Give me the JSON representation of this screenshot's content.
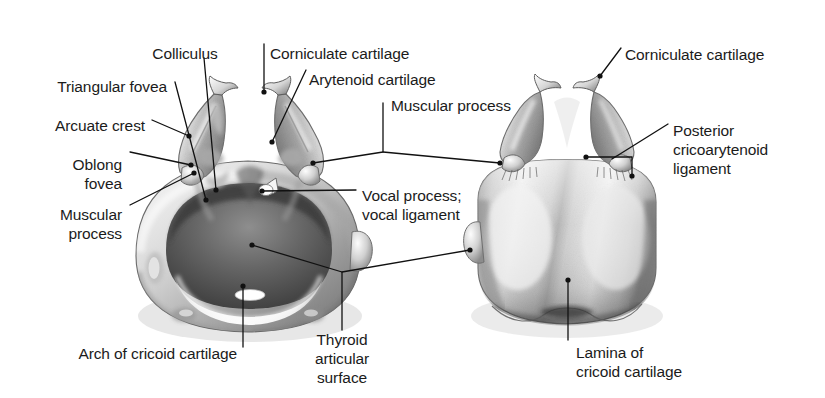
{
  "figure": {
    "background_color": "#ffffff",
    "ink_color": "#1b1b1b",
    "width": 825,
    "height": 398
  },
  "views": [
    {
      "name": "anterosuperior-view",
      "description": "Cricoid cartilage seen from above and in front with paired arytenoid cartilages"
    },
    {
      "name": "posterior-view",
      "description": "Cricoid cartilage seen from behind with paired arytenoid cartilages"
    }
  ],
  "labels": [
    {
      "id": "colliculus",
      "text": "Colliculus",
      "x": 185,
      "y": 52,
      "align": "center",
      "lines": 1
    },
    {
      "id": "triangular-fovea",
      "text": "Triangular fovea",
      "x": 167,
      "y": 85,
      "align": "right",
      "lines": 1
    },
    {
      "id": "arcuate-crest",
      "text": "Arcuate crest",
      "x": 145,
      "y": 124,
      "align": "right",
      "lines": 1
    },
    {
      "id": "oblong-fovea",
      "text": "Oblong\nfovea",
      "x": 122,
      "y": 163,
      "align": "right",
      "lines": 2
    },
    {
      "id": "muscular-process-left",
      "text": "Muscular\nprocess",
      "x": 122,
      "y": 213,
      "align": "right",
      "lines": 2
    },
    {
      "id": "corniculate-cartilage-left",
      "text": "Corniculate cartilage",
      "x": 270,
      "y": 52,
      "align": "left",
      "lines": 1
    },
    {
      "id": "arytenoid-cartilage",
      "text": "Arytenoid cartilage",
      "x": 309,
      "y": 78,
      "align": "left",
      "lines": 1
    },
    {
      "id": "muscular-process-center",
      "text": "Muscular process",
      "x": 387,
      "y": 105,
      "align": "left",
      "lines": 1
    },
    {
      "id": "vocal-process-vocal-ligament",
      "text": "Vocal process;\nvocal ligament",
      "x": 362,
      "y": 195,
      "align": "left",
      "lines": 2
    },
    {
      "id": "corniculate-cartilage-right",
      "text": "Corniculate cartilage",
      "x": 625,
      "y": 53,
      "align": "left",
      "lines": 1
    },
    {
      "id": "posterior-cricoarytenoid-ligament",
      "text": "Posterior\ncricoarytenoid\nligament",
      "x": 672,
      "y": 130,
      "align": "left",
      "lines": 3
    },
    {
      "id": "thyroid-articular-surface",
      "text": "Thyroid\narticular\nsurface",
      "x": 342,
      "y": 348,
      "align": "center",
      "lines": 3
    },
    {
      "id": "arch-of-cricoid-cartilage",
      "text": "Arch of cricoid cartilage",
      "x": 237,
      "y": 352,
      "align": "right",
      "lines": 1
    },
    {
      "id": "lamina-of-cricoid-cartilage",
      "text": "Lamina of\ncricoid cartilage",
      "x": 576,
      "y": 351,
      "align": "left",
      "lines": 2
    }
  ],
  "leader_lines": [
    {
      "id": "leader-colliculus",
      "points": "204,58 216,190",
      "dot": "216,190"
    },
    {
      "id": "leader-triangular-fovea",
      "points": "172,82 205,200",
      "dot": "205,200"
    },
    {
      "id": "leader-arcuate-crest",
      "points": "150,120 188,135",
      "dot": "188,135"
    },
    {
      "id": "leader-oblong-fovea",
      "points": "128,152 190,165",
      "dot": "190,165"
    },
    {
      "id": "leader-muscular-process-left",
      "points": "128,204 193,174",
      "dot": "193,174"
    },
    {
      "id": "leader-corniculate-cartilage-left",
      "points": "264,44 264,92",
      "dot": "264,92"
    },
    {
      "id": "leader-arytenoid-cartilage",
      "points": "305,70 272,141",
      "dot": "272,141"
    },
    {
      "id": "leader-muscular-process-center",
      "points": "383,103 383,152 313,163",
      "dot": "313,163"
    },
    {
      "id": "leader-muscular-process-center-right",
      "points": "383,152 500,163",
      "dot": "500,163"
    },
    {
      "id": "leader-vocal-process",
      "points": "355,190 260,191",
      "dot": "260,191"
    },
    {
      "id": "leader-corniculate-cartilage-right",
      "points": "620,48 600,75",
      "dot": "600,75"
    },
    {
      "id": "leader-posterior-cricoarytenoid",
      "points": "667,124 611,159",
      "dot": "611,159"
    },
    {
      "id": "leader-pcl-bracket",
      "points": "585,157 631,157 631,175",
      "dot": "585,157"
    },
    {
      "id": "leader-thyroid-articular-surface",
      "points": "342,302 342,272 250,245",
      "dot": "250,245"
    },
    {
      "id": "leader-thyroid-articular-right",
      "points": "342,272 472,250",
      "dot": "472,250"
    },
    {
      "id": "leader-arch-of-cricoid",
      "points": "243,347 243,285",
      "dot": "243,285"
    },
    {
      "id": "leader-lamina-of-cricoid",
      "points": "568,340 568,279",
      "dot": "568,279"
    }
  ]
}
